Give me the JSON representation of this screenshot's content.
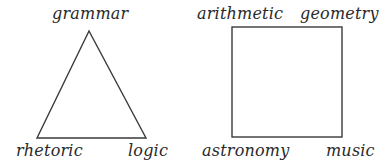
{
  "diagram": {
    "type": "liberal-arts-shapes",
    "trivium": {
      "shape": "triangle",
      "vertices": [
        {
          "position": "top",
          "label": "grammar"
        },
        {
          "position": "bottom-left",
          "label": "rhetoric"
        },
        {
          "position": "bottom-right",
          "label": "logic"
        }
      ]
    },
    "quadrivium": {
      "shape": "square",
      "vertices": [
        {
          "position": "top-left",
          "label": "arithmetic"
        },
        {
          "position": "top-right",
          "label": "geometry"
        },
        {
          "position": "bottom-left",
          "label": "astronomy"
        },
        {
          "position": "bottom-right",
          "label": "music"
        }
      ]
    },
    "colors": {
      "stroke": "#3a3a3a",
      "text": "#2a2a2a",
      "background": "#ffffff"
    }
  }
}
